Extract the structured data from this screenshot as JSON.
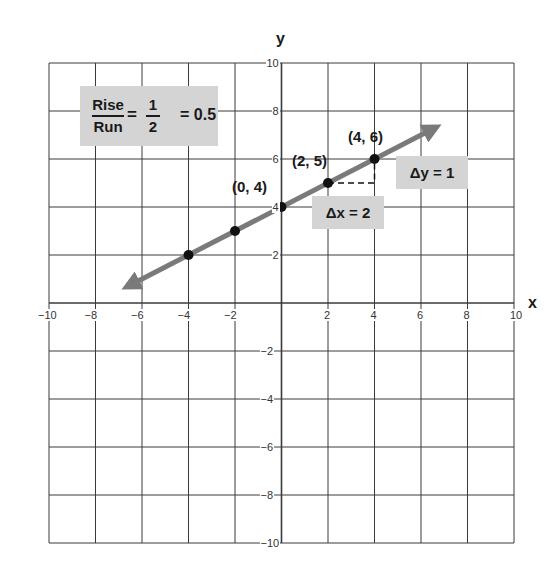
{
  "chart_data": {
    "type": "line",
    "title": "",
    "xlabel": "x",
    "ylabel": "y",
    "xlim": [
      -10,
      10
    ],
    "ylim": [
      -10,
      10
    ],
    "grid": true,
    "x_ticks": [
      -10,
      -8,
      -6,
      -4,
      -2,
      2,
      4,
      6,
      8,
      10
    ],
    "y_ticks": [
      10,
      8,
      6,
      4,
      2,
      -2,
      -4,
      -6,
      -8,
      -10
    ],
    "series": [
      {
        "name": "y = 0.5x + 4",
        "slope": 0.5,
        "intercept": 4,
        "line_extent": {
          "x_start": -6.5,
          "x_end": 6.5
        },
        "points": [
          {
            "x": -4,
            "y": 2
          },
          {
            "x": -2,
            "y": 3
          },
          {
            "x": 0,
            "y": 4
          },
          {
            "x": 2,
            "y": 5
          },
          {
            "x": 4,
            "y": 6
          }
        ],
        "color": "#7a7a7a"
      }
    ],
    "annotations": [
      {
        "text": "(0,4)",
        "x": 0,
        "y": 4
      },
      {
        "text": "(2,5)",
        "x": 2,
        "y": 5
      },
      {
        "text": "(4,6)",
        "x": 4,
        "y": 6
      },
      {
        "text": "Δy = 1",
        "x": 5.5,
        "y": 5.5
      },
      {
        "text": "Δx = 2",
        "x": 3,
        "y": 4
      },
      {
        "text": "Rise/Run = 1/2 = 0.5",
        "x": -6,
        "y": 8
      }
    ]
  },
  "labels": {
    "x_axis": "x",
    "y_axis": "y",
    "ratio": {
      "rise": "Rise",
      "run": "Run",
      "eq": "=",
      "num": "1",
      "den": "2",
      "result": "= 0.5"
    },
    "delta_y": "Δy = 1",
    "delta_x": "Δx = 2",
    "points": {
      "p0": "(0, 4)",
      "p1": "(2, 5)",
      "p2": "(4, 6)"
    }
  },
  "colors": {
    "grid": "#3a3a3a",
    "line": "#7a7a7a",
    "point": "#111111",
    "box": "#d4d4d4"
  }
}
